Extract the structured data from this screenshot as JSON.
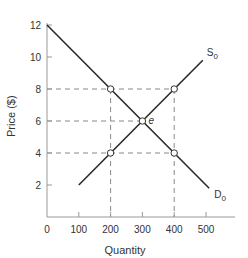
{
  "chart_data": {
    "type": "line",
    "title": "",
    "xlabel": "Quantity",
    "ylabel": "Price ($)",
    "xlim": [
      0,
      580
    ],
    "ylim": [
      0,
      12
    ],
    "xticks": [
      0,
      100,
      200,
      300,
      400,
      500
    ],
    "yticks": [
      2,
      4,
      6,
      8,
      10,
      12
    ],
    "grid": false,
    "series": [
      {
        "name": "S0",
        "label_main": "S",
        "label_sub": "0",
        "points": [
          [
            100,
            2
          ],
          [
            490,
            9.8
          ]
        ]
      },
      {
        "name": "D0",
        "label_main": "D",
        "label_sub": "0",
        "points": [
          [
            0,
            12
          ],
          [
            510,
            1.8
          ]
        ]
      }
    ],
    "markers": [
      {
        "x": 200,
        "y": 8
      },
      {
        "x": 400,
        "y": 8
      },
      {
        "x": 300,
        "y": 6,
        "label": "e"
      },
      {
        "x": 200,
        "y": 4
      },
      {
        "x": 400,
        "y": 4
      }
    ],
    "dashed_guides": {
      "horizontal": [
        8,
        6,
        4
      ],
      "vertical": [
        200,
        400
      ]
    },
    "annotations": [
      {
        "text": "e",
        "x": 300,
        "y": 6,
        "note": "equilibrium point"
      }
    ]
  }
}
